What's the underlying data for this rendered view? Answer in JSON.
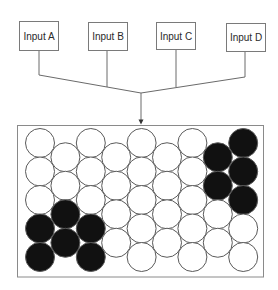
{
  "diagram": {
    "inputs": [
      {
        "label": "Input A"
      },
      {
        "label": "Input B"
      },
      {
        "label": "Input C"
      },
      {
        "label": "Input D"
      }
    ],
    "connector": {
      "type": "merge-arrow",
      "direction": "down",
      "target": "circle-grid"
    },
    "grid": {
      "columns": 9,
      "rows_odd_columns": 5,
      "rows_even_columns": 4,
      "layout": "hexagonal-staggered",
      "filled_color": "#111111",
      "empty_color": "#ffffff",
      "stroke_color": "#5a5a5a",
      "filled_cells": [
        {
          "col": 0,
          "rows": [
            3,
            4
          ]
        },
        {
          "col": 1,
          "rows": [
            2,
            3
          ]
        },
        {
          "col": 2,
          "rows": [
            3,
            4
          ]
        },
        {
          "col": 7,
          "rows": [
            0,
            1
          ]
        },
        {
          "col": 8,
          "rows": [
            0,
            1,
            2
          ]
        }
      ]
    },
    "colors": {
      "line": "#6a6a6a",
      "frame": "#8a8a8a",
      "text": "#2a2a2a"
    }
  }
}
